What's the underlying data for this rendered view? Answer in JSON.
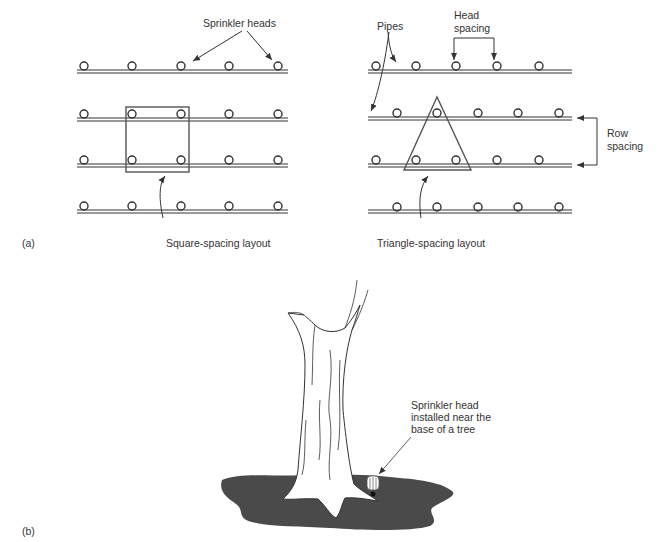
{
  "panel_a": {
    "label": "(a)",
    "square_layout": {
      "caption": "Square-spacing layout",
      "callout": "Sprinkler heads",
      "rows": 4,
      "heads_per_row": 5
    },
    "triangle_layout": {
      "caption": "Triangle-spacing layout",
      "callout_pipes": "Pipes",
      "callout_head_spacing_line1": "Head",
      "callout_head_spacing_line2": "spacing",
      "callout_row_spacing_line1": "Row",
      "callout_row_spacing_line2": "spacing",
      "rows": 4,
      "heads_per_row": 5
    }
  },
  "panel_b": {
    "label": "(b)",
    "callout_line1": "Sprinkler head",
    "callout_line2": "installed near the",
    "callout_line3": "base  of a tree"
  },
  "colors": {
    "line": "#333333",
    "ground": "#4a4a4a",
    "background": "#ffffff"
  }
}
